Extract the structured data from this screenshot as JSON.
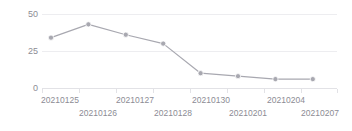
{
  "chart_data": {
    "type": "line",
    "title": "",
    "subtitle": "",
    "xlabel": "",
    "ylabel": "",
    "categories": [
      "20210125",
      "20210126",
      "20210127",
      "20210128",
      "20210130",
      "20210201",
      "20210204",
      "20210207"
    ],
    "x": [
      "20210125",
      "20210126",
      "20210127",
      "20210128",
      "20210130",
      "20210201",
      "20210204",
      "20210207"
    ],
    "values": [
      34,
      43,
      36,
      30,
      10,
      8,
      6,
      6
    ],
    "series": [
      {
        "name": "",
        "values": [
          34,
          43,
          36,
          30,
          10,
          8,
          6,
          6
        ]
      }
    ],
    "ylim": [
      0,
      50
    ],
    "yticks": [
      0,
      25,
      50
    ],
    "ytick_labels": [
      "0",
      "25",
      "50"
    ],
    "xtick_labels": [
      "20210125",
      "20210126",
      "20210127",
      "20210128",
      "20210130",
      "20210201",
      "20210204",
      "20210207"
    ],
    "grid": true,
    "legend": false,
    "legend_position": "none",
    "line_color": "#a8a8b0",
    "marker_color": "#a8a8b0",
    "grid_color": "#ededf0",
    "axis_color": "#e2e2e6",
    "text_color": "#8c8c94"
  },
  "axis": {
    "y_labels": [
      "50",
      "25",
      "0"
    ],
    "x_labels_top": [
      "20210125",
      "20210127",
      "20210130",
      "20210204"
    ],
    "x_labels_bottom": [
      "20210126",
      "20210128",
      "20210201",
      "20210207"
    ]
  }
}
